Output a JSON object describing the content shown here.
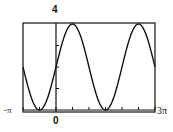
{
  "chart_data": {
    "type": "line",
    "title": "",
    "function": "y = 2 + 2 sin(x)",
    "xlabel": "",
    "ylabel": "",
    "xlim": [
      -3.14159,
      9.42478
    ],
    "ylim": [
      0,
      4
    ],
    "x_tick_labels": [
      "-π",
      "0",
      "3π"
    ],
    "y_tick_labels": [
      "4"
    ],
    "x_tick_interval": "π/2",
    "y_tick_interval": 1,
    "grid": false,
    "legend": null,
    "series": [
      {
        "name": "curve",
        "x": [
          -3.14159,
          -2.35619,
          -1.5708,
          -0.7854,
          0,
          0.7854,
          1.5708,
          2.35619,
          3.14159,
          3.92699,
          4.71239,
          5.49779,
          6.28319,
          7.06858,
          7.85398,
          8.63938,
          9.42478
        ],
        "values": [
          2,
          0.59,
          0,
          0.59,
          2,
          3.41,
          4,
          3.41,
          2,
          0.59,
          0,
          0.59,
          2,
          3.41,
          4,
          3.41,
          2
        ]
      }
    ]
  },
  "labels": {
    "y_max": "4",
    "x_min": "-π",
    "x_max": "3π",
    "origin": "0"
  },
  "colors": {
    "line": "#111111",
    "frame": "#111111",
    "background": "#ffffff"
  }
}
